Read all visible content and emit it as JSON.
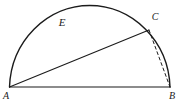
{
  "figure": {
    "labels": {
      "A": "A",
      "B": "B",
      "C": "C",
      "E": "E"
    },
    "colors": {
      "line": "#1b1b1b",
      "background": "#ffffff"
    },
    "diagram_data": {
      "type": "geometry",
      "description_elements": [
        "semicircle on diameter AB",
        "point C on arc near upper right",
        "solid chord from A to C",
        "dashed chord from C to B",
        "label E on upper-left arc"
      ]
    }
  }
}
